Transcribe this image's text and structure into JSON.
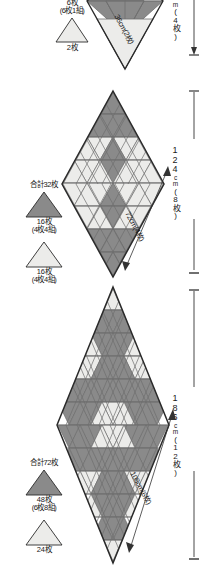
{
  "doc": {
    "kind": "japanese-patchwork-diagram",
    "description": "Three diamond (rhombus) quilt layouts built from equilateral triangles, with piece-count legends and finished dimensions."
  },
  "colors": {
    "dark_triangle": "#8a8a8a",
    "light_triangle": "#ececea",
    "outline": "#2a2a2a",
    "grid_line": "#6f6f6f",
    "dimension_line": "#333333",
    "background": "#ffffff"
  },
  "panels": [
    {
      "id": "small",
      "rows": 4,
      "legend": {
        "total": "",
        "dark": {
          "count": "6枚",
          "sub": "(6枚1組)"
        },
        "light": {
          "count": "2枚",
          "sub": ""
        }
      },
      "height_dim": {
        "num": "",
        "unit": "cm",
        "pieces": "(4枚)"
      },
      "side_dim": {
        "value": "36cm",
        "pieces": "(2枚)"
      }
    },
    {
      "id": "medium",
      "rows": 8,
      "legend": {
        "total": "合計32枚",
        "dark": {
          "count": "16枚",
          "sub": "(4枚4組)"
        },
        "light": {
          "count": "16枚",
          "sub": "(4枚4組)"
        }
      },
      "height_dim": {
        "num": "124",
        "unit": "cm",
        "pieces": "(8枚)"
      },
      "side_dim": {
        "value": "72cm",
        "pieces": "(4枚)"
      }
    },
    {
      "id": "large",
      "rows": 12,
      "legend": {
        "total": "合計72枚",
        "dark": {
          "count": "48枚",
          "sub": "(6枚8組)"
        },
        "light": {
          "count": "24枚",
          "sub": ""
        }
      },
      "height_dim": {
        "num": "186",
        "unit": "cm",
        "pieces": "(12枚)"
      },
      "side_dim": {
        "value": "108cm",
        "pieces": "(6枚)"
      }
    }
  ]
}
